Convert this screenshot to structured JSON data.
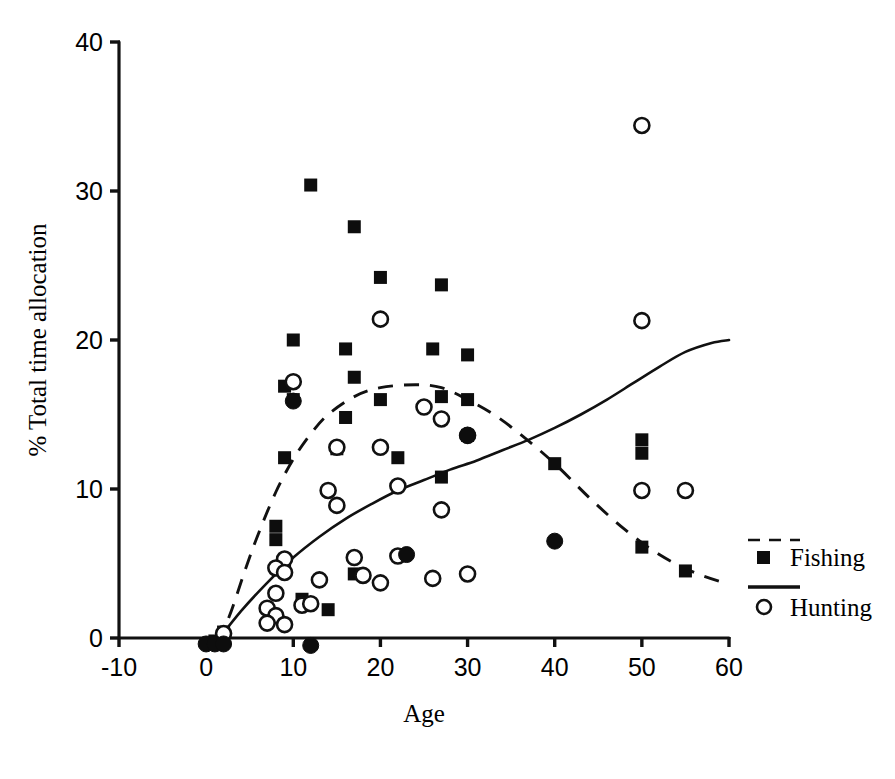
{
  "chart_data": {
    "type": "scatter",
    "title": "",
    "xlabel": "Age",
    "ylabel": "% Total time allocation",
    "xlim": [
      -10,
      60
    ],
    "ylim": [
      0,
      40
    ],
    "xticks": [
      -10,
      0,
      10,
      20,
      30,
      40,
      50,
      60
    ],
    "xticklabels": [
      "-10",
      "0",
      "10",
      "20",
      "30",
      "40",
      "50",
      "60"
    ],
    "yticks": [
      0,
      10,
      20,
      30,
      40
    ],
    "yticklabels": [
      "0",
      "10",
      "20",
      "30",
      "40"
    ],
    "grid": false,
    "legend_position": "right",
    "series": [
      {
        "name": "Fishing",
        "marker": "filled-square",
        "fit_line_style": "dashed",
        "points": [
          [
            12,
            30.4
          ],
          [
            17,
            27.6
          ],
          [
            20,
            24.2
          ],
          [
            27,
            23.7
          ],
          [
            10,
            20.0
          ],
          [
            26,
            19.4
          ],
          [
            16,
            19.4
          ],
          [
            30,
            19.0
          ],
          [
            17,
            17.5
          ],
          [
            9,
            16.9
          ],
          [
            10,
            16.0
          ],
          [
            20,
            16.0
          ],
          [
            27,
            16.2
          ],
          [
            30,
            16.0
          ],
          [
            16,
            14.8
          ],
          [
            15,
            12.7
          ],
          [
            22,
            12.1
          ],
          [
            9,
            12.1
          ],
          [
            40,
            11.7
          ],
          [
            27,
            10.8
          ],
          [
            30,
            13.6
          ],
          [
            50,
            13.3
          ],
          [
            50,
            12.4
          ],
          [
            8,
            7.5
          ],
          [
            8,
            6.6
          ],
          [
            50,
            6.1
          ],
          [
            55,
            4.5
          ],
          [
            9,
            4.5
          ],
          [
            17,
            4.3
          ],
          [
            11,
            2.6
          ],
          [
            14,
            1.9
          ],
          [
            2,
            0.4
          ],
          [
            1,
            -0.2
          ]
        ]
      },
      {
        "name": "Hunting",
        "marker": "open-circle",
        "fit_line_style": "solid",
        "points": [
          [
            50,
            34.4
          ],
          [
            20,
            21.4
          ],
          [
            50,
            21.3
          ],
          [
            10,
            17.2
          ],
          [
            25,
            15.5
          ],
          [
            27,
            14.7
          ],
          [
            30,
            13.6
          ],
          [
            15,
            12.8
          ],
          [
            20,
            12.8
          ],
          [
            22,
            10.2
          ],
          [
            14,
            9.9
          ],
          [
            50,
            9.9
          ],
          [
            55,
            9.9
          ],
          [
            27,
            8.6
          ],
          [
            15,
            8.9
          ],
          [
            22,
            5.5
          ],
          [
            17,
            5.4
          ],
          [
            9,
            5.3
          ],
          [
            8,
            4.7
          ],
          [
            9,
            4.4
          ],
          [
            18,
            4.2
          ],
          [
            20,
            3.7
          ],
          [
            30,
            4.3
          ],
          [
            26,
            4.0
          ],
          [
            13,
            3.9
          ],
          [
            8,
            3.0
          ],
          [
            11,
            2.2
          ],
          [
            12,
            2.3
          ],
          [
            7,
            2.0
          ],
          [
            8,
            1.5
          ],
          [
            7,
            1.0
          ],
          [
            9,
            0.9
          ],
          [
            2,
            0.3
          ]
        ]
      },
      {
        "name": "Overlapping points",
        "marker": "filled-circle",
        "points": [
          [
            40,
            6.5
          ],
          [
            23,
            5.6
          ],
          [
            30,
            13.6
          ],
          [
            10,
            15.9
          ],
          [
            12,
            -0.5
          ],
          [
            0,
            -0.4
          ],
          [
            1,
            -0.4
          ],
          [
            2,
            -0.4
          ]
        ]
      }
    ],
    "fit_curves": [
      {
        "name": "Fishing fit",
        "style": "dashed",
        "points": [
          [
            1.5,
            -0.3
          ],
          [
            3,
            2.0
          ],
          [
            4.5,
            4.6
          ],
          [
            6,
            7.0
          ],
          [
            8,
            9.8
          ],
          [
            10,
            12.0
          ],
          [
            12,
            13.7
          ],
          [
            14,
            15.0
          ],
          [
            17,
            16.2
          ],
          [
            20,
            16.8
          ],
          [
            24,
            17.0
          ],
          [
            27,
            16.8
          ],
          [
            30,
            16.0
          ],
          [
            33,
            15.0
          ],
          [
            36,
            13.7
          ],
          [
            40,
            11.7
          ],
          [
            44,
            9.4
          ],
          [
            48,
            7.3
          ],
          [
            52,
            5.6
          ],
          [
            56,
            4.4
          ],
          [
            60,
            3.6
          ]
        ]
      },
      {
        "name": "Hunting fit",
        "style": "solid",
        "points": [
          [
            1,
            -0.4
          ],
          [
            4,
            1.8
          ],
          [
            7,
            3.7
          ],
          [
            10,
            5.4
          ],
          [
            13,
            6.8
          ],
          [
            16,
            8.0
          ],
          [
            19,
            9.0
          ],
          [
            22,
            9.9
          ],
          [
            25,
            10.6
          ],
          [
            28,
            11.3
          ],
          [
            31,
            11.9
          ],
          [
            34,
            12.6
          ],
          [
            37,
            13.3
          ],
          [
            40,
            14.1
          ],
          [
            43,
            15.0
          ],
          [
            46,
            16.0
          ],
          [
            49,
            17.1
          ],
          [
            52,
            18.2
          ],
          [
            55,
            19.2
          ],
          [
            58,
            19.8
          ],
          [
            60,
            20.0
          ]
        ]
      }
    ]
  },
  "legend": {
    "items": [
      {
        "label": "Fishing",
        "marker": "filled-square",
        "line": "dashed"
      },
      {
        "label": "Hunting",
        "marker": "open-circle",
        "line": "solid"
      }
    ]
  },
  "axis": {
    "x_title": "Age",
    "y_title": "% Total time allocation"
  }
}
